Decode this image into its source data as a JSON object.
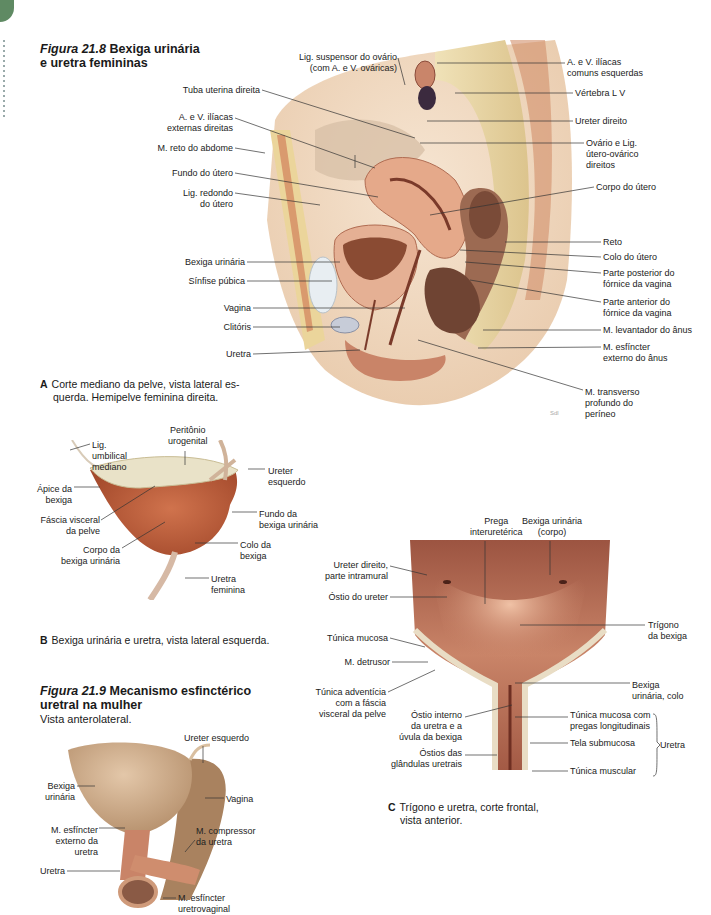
{
  "side_tab": {
    "color": "#5f8a63"
  },
  "figure_21_8": {
    "number": "Figura 21.8",
    "title": "Bexiga urinária",
    "title_line2": "e uretra femininas",
    "panel_a": {
      "letter": "A",
      "caption_line1": "Corte mediano da pelve, vista lateral es-",
      "caption_line2": "querda. Hemipelve feminina direita.",
      "labels_left": [
        "Lig. suspensor do ovário",
        "(com A. e V. ováricas)",
        "Tuba uterina direita",
        "A. e V. ilíacas",
        "externas direitas",
        "M. reto do abdome",
        "Fundo do útero",
        "Lig. redondo",
        "do útero",
        "Bexiga urinária",
        "Sínfise púbica",
        "Vagina",
        "Clitóris",
        "Uretra"
      ],
      "labels_right": [
        "A. e V. ilíacas",
        "comuns esquerdas",
        "Vértebra L V",
        "Ureter direito",
        "Ovário e Lig.",
        "útero-ovárico",
        "direitos",
        "Corpo do útero",
        "Reto",
        "Colo do útero",
        "Parte posterior do",
        "fórnice da vagina",
        "Parte anterior do",
        "fórnice da vagina",
        "M. levantador do ânus",
        "M. esfíncter",
        "externo do ânus",
        "M. transverso",
        "profundo do",
        "períneo"
      ]
    },
    "panel_b": {
      "letter": "B",
      "caption": "Bexiga urinária e uretra, vista lateral esquerda.",
      "labels": [
        "Lig.",
        "umbilical",
        "mediano",
        "Peritônio",
        "urogenital",
        "Ureter",
        "esquerdo",
        "Ápice da",
        "bexiga",
        "Fáscia visceral",
        "da pelve",
        "Fundo da",
        "bexiga urinária",
        "Corpo da",
        "bexiga urinária",
        "Colo da",
        "bexiga",
        "Uretra",
        "feminina"
      ]
    },
    "panel_c": {
      "letter": "C",
      "caption_line1": "Trígono e uretra, corte frontal,",
      "caption_line2": "vista anterior.",
      "labels": [
        "Prega",
        "interuretérica",
        "Bexiga urinária",
        "(corpo)",
        "Ureter direito,",
        "parte intramural",
        "Óstio do ureter",
        "Trígono",
        "da bexiga",
        "Túnica mucosa",
        "M. detrusor",
        "Túnica adventícia",
        "com a fáscia",
        "visceral da pelve",
        "Bexiga",
        "urinária, colo",
        "Óstio interno",
        "da uretra e a",
        "úvula da bexiga",
        "Túnica mucosa com",
        "pregas longitudinais",
        "Tela submucosa",
        "Uretra",
        "Óstios das",
        "glândulas uretrais",
        "Túnica muscular"
      ]
    }
  },
  "figure_21_9": {
    "number": "Figura 21.9",
    "title": "Mecanismo esfinctérico",
    "title_line2": "uretral na mulher",
    "subtitle": "Vista anterolateral.",
    "labels": [
      "Ureter esquerdo",
      "Bexiga",
      "urinária",
      "Vagina",
      "M. esfíncter",
      "externo da",
      "uretra",
      "M. compressor",
      "da uretra",
      "Uretra",
      "M. esfíncter",
      "uretrovaginal"
    ]
  },
  "colors": {
    "tissue_flesh": "#e9c9a8",
    "muscle": "#b85a3c",
    "mucosa": "#c98468",
    "bone": "#ead9a8",
    "skin": "#f1dcc5",
    "bladder_beige": "#cfae8c"
  }
}
